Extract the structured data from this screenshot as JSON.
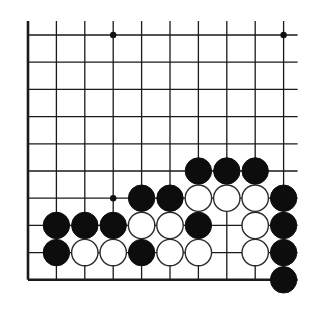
{
  "diagram": {
    "type": "go-board-fragment",
    "colors": {
      "line": "#1a1a1a",
      "black": "#0d0d0d",
      "white": "#ffffff",
      "background": "#ffffff"
    },
    "grid": {
      "cols": 10,
      "rows": 10,
      "origin_x": 28,
      "origin_y": 35,
      "spacing_x": 28.4,
      "spacing_y": 27.2,
      "edges": {
        "left": true,
        "bottom": true,
        "top": false,
        "right": false
      },
      "overhang": 14
    },
    "star_points": [
      {
        "col": 3,
        "row": 0
      },
      {
        "col": 9,
        "row": 0
      },
      {
        "col": 3,
        "row": 6
      }
    ],
    "stones": [
      {
        "col": 6,
        "row": 5,
        "color": "black"
      },
      {
        "col": 7,
        "row": 5,
        "color": "black"
      },
      {
        "col": 8,
        "row": 5,
        "color": "black"
      },
      {
        "col": 4,
        "row": 6,
        "color": "black"
      },
      {
        "col": 5,
        "row": 6,
        "color": "black"
      },
      {
        "col": 6,
        "row": 6,
        "color": "white"
      },
      {
        "col": 7,
        "row": 6,
        "color": "white"
      },
      {
        "col": 8,
        "row": 6,
        "color": "white"
      },
      {
        "col": 9,
        "row": 6,
        "color": "black"
      },
      {
        "col": 1,
        "row": 7,
        "color": "black"
      },
      {
        "col": 2,
        "row": 7,
        "color": "black"
      },
      {
        "col": 3,
        "row": 7,
        "color": "black"
      },
      {
        "col": 4,
        "row": 7,
        "color": "white"
      },
      {
        "col": 5,
        "row": 7,
        "color": "white"
      },
      {
        "col": 6,
        "row": 7,
        "color": "black"
      },
      {
        "col": 8,
        "row": 7,
        "color": "white"
      },
      {
        "col": 9,
        "row": 7,
        "color": "black"
      },
      {
        "col": 1,
        "row": 8,
        "color": "black"
      },
      {
        "col": 2,
        "row": 8,
        "color": "white"
      },
      {
        "col": 3,
        "row": 8,
        "color": "white"
      },
      {
        "col": 4,
        "row": 8,
        "color": "black"
      },
      {
        "col": 5,
        "row": 8,
        "color": "white"
      },
      {
        "col": 6,
        "row": 8,
        "color": "white"
      },
      {
        "col": 8,
        "row": 8,
        "color": "white"
      },
      {
        "col": 9,
        "row": 8,
        "color": "black"
      },
      {
        "col": 9,
        "row": 9,
        "color": "black"
      }
    ],
    "stone_radius": 13.2,
    "star_radius": 3.2
  }
}
